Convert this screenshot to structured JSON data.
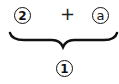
{
  "diagram": {
    "top_left": "2",
    "operator": "+",
    "top_right": "a",
    "bottom": "1",
    "connector": "underbrace"
  }
}
